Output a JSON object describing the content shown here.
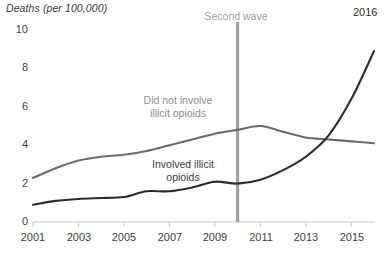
{
  "chart_data": {
    "type": "line",
    "title": "Deaths (per 100,000)",
    "ylabel": "Deaths (per 100,000)",
    "xlabel": "",
    "xlim": [
      2001,
      2016
    ],
    "ylim": [
      0,
      10
    ],
    "grid": false,
    "legend_position": "inline-labels",
    "x": [
      2001,
      2002,
      2003,
      2004,
      2005,
      2006,
      2007,
      2008,
      2009,
      2010,
      2011,
      2012,
      2013,
      2014,
      2015,
      2016
    ],
    "xticks": [
      "2001",
      "2003",
      "2005",
      "2007",
      "2009",
      "2011",
      "2013",
      "2015"
    ],
    "xtick_values": [
      2001,
      2003,
      2005,
      2007,
      2009,
      2011,
      2013,
      2015
    ],
    "yticks": [
      "0",
      "2",
      "4",
      "6",
      "8",
      "10"
    ],
    "ytick_values": [
      0,
      2,
      4,
      6,
      8,
      10
    ],
    "series": [
      {
        "name": "Did not involve illicit opioids",
        "color": "#6b6b6b",
        "values": [
          2.3,
          2.8,
          3.2,
          3.4,
          3.5,
          3.7,
          4.0,
          4.3,
          4.6,
          4.8,
          5.0,
          4.7,
          4.4,
          4.3,
          4.2,
          4.1
        ]
      },
      {
        "name": "Involved illicit opioids",
        "color": "#2b2b2b",
        "values": [
          0.9,
          1.1,
          1.2,
          1.25,
          1.3,
          1.6,
          1.6,
          1.8,
          2.1,
          2.0,
          2.2,
          2.7,
          3.4,
          4.5,
          6.4,
          8.9
        ]
      }
    ],
    "annotations": [
      {
        "name": "second-wave",
        "label": "Second wave",
        "x": 2010,
        "color": "#a0a0a0",
        "type": "vertical-line"
      },
      {
        "name": "endpoint-year",
        "label": "2016",
        "x": 2016,
        "y": 8.9,
        "color": "#2f2f2f",
        "type": "point-label"
      }
    ],
    "series_labels": [
      {
        "name": "did-not-involve-label",
        "lines": [
          "Did not involve",
          "illicit opioids"
        ],
        "color": "#8d8d8d"
      },
      {
        "name": "involved-label",
        "lines": [
          "Involved illicit",
          "opioids"
        ],
        "color": "#3a3a3a"
      }
    ]
  },
  "axis": {
    "y_label_10": "10",
    "y_label_8": "8",
    "y_label_6": "6",
    "y_label_4": "4",
    "y_label_2": "2",
    "y_label_0": "0",
    "x_label_2001": "2001",
    "x_label_2003": "2003",
    "x_label_2005": "2005",
    "x_label_2007": "2007",
    "x_label_2009": "2009",
    "x_label_2011": "2011",
    "x_label_2013": "2013",
    "x_label_2015": "2015",
    "title": "Deaths (per 100,000)"
  },
  "labels": {
    "gray_line_1": "Did not involve",
    "gray_line_2": "illicit opioids",
    "dark_line_1": "Involved illicit",
    "dark_line_2": "opioids",
    "second_wave": "Second wave",
    "endpoint_year": "2016"
  },
  "colors": {
    "gray_series": "#6b6b6b",
    "dark_series": "#2b2b2b",
    "annotation_line": "#a8a8a8",
    "axis": "#c8c8c8",
    "text": "#3f3f3f"
  }
}
